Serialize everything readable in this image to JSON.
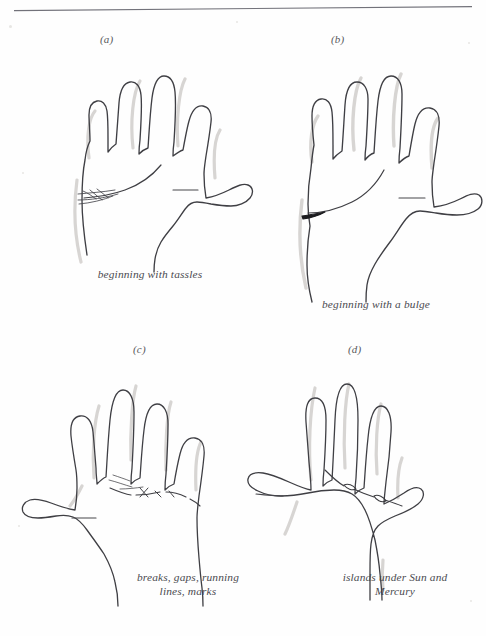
{
  "page": {
    "background_color": "#fefefe",
    "ink_color": "#3a3a3e",
    "shadow_color": "#b9b4b0",
    "accent_dark": "#1d1d20",
    "width": 486,
    "height": 636
  },
  "divider": {
    "name": "top-horizontal-rule",
    "color": "#6f6f74"
  },
  "figures": [
    {
      "id": "a",
      "label": "(a)",
      "caption": "beginning with tassles",
      "hand": "right",
      "feature": "tassles",
      "feature_description": "heart line beginning with fine splayed tassle strokes"
    },
    {
      "id": "b",
      "label": "(b)",
      "caption": "beginning with a bulge",
      "hand": "right",
      "feature": "bulge",
      "feature_description": "heart line beginning with a thick dark bulge"
    },
    {
      "id": "c",
      "label": "(c)",
      "caption": "breaks, gaps, running\nlines, marks",
      "hand": "left",
      "feature": "breaks",
      "feature_description": "heart line with breaks, gaps, running lines and crossing marks"
    },
    {
      "id": "d",
      "label": "(d)",
      "caption": "islands under Sun and\nMercury",
      "hand": "left",
      "feature": "islands",
      "feature_description": "heart line with two island loops below the Sun and Mercury fingers"
    }
  ]
}
